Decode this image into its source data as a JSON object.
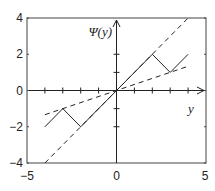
{
  "chart_data": {
    "type": "line",
    "title": "",
    "xlabel": "y",
    "ylabel": "Ψ(y)",
    "xlim": [
      -5,
      5
    ],
    "ylim": [
      -4,
      4
    ],
    "xticks": [
      -5,
      0,
      5
    ],
    "yticks": [
      -4,
      -2,
      0,
      2,
      4
    ],
    "inner_xticks": [
      -4,
      -3,
      -2,
      -1,
      1,
      2,
      3,
      4
    ],
    "inner_yticks": [
      -2,
      -1,
      1,
      2
    ],
    "grid": false,
    "legend": null,
    "series": [
      {
        "name": "Ψ(y)",
        "style": "solid",
        "x": [
          -4,
          -3,
          -2,
          2,
          3,
          4
        ],
        "y": [
          -2,
          -1,
          -2,
          2,
          1,
          2
        ]
      },
      {
        "name": "y",
        "style": "dashed",
        "x": [
          -4,
          4.1
        ],
        "y": [
          -4,
          4.1
        ]
      },
      {
        "name": "y/3",
        "style": "dashed",
        "x": [
          -4,
          4
        ],
        "y": [
          -1.333,
          1.333
        ]
      }
    ]
  },
  "labels": {
    "ylabel": "Ψ(y)",
    "xlabel": "y",
    "xtick_labels": [
      "−5",
      "0",
      "5"
    ],
    "ytick_labels": [
      "4",
      "2",
      "0",
      "−2",
      "−4"
    ]
  }
}
